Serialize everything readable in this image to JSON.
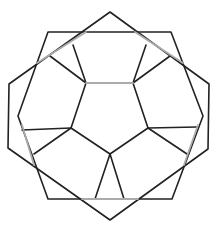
{
  "figure": {
    "colors": {
      "background": "#ffffff",
      "line_dark": "#222222",
      "line_gray": "#ababab"
    },
    "tilted_hexagon": [
      [
        110,
        12
      ],
      [
        209,
        84
      ],
      [
        208,
        149
      ],
      [
        110,
        220
      ],
      [
        8,
        148
      ],
      [
        9,
        84
      ]
    ],
    "upright_hexagon": [
      [
        48,
        32
      ],
      [
        171,
        32
      ],
      [
        203,
        116
      ],
      [
        172,
        199
      ],
      [
        48,
        199
      ],
      [
        18,
        116
      ]
    ],
    "center_pentagon": [
      [
        86,
        83
      ],
      [
        133,
        83
      ],
      [
        148,
        128
      ],
      [
        110,
        154
      ],
      [
        71,
        128
      ]
    ],
    "spokes": [
      [
        [
          86,
          83
        ],
        [
          73,
          45
        ]
      ],
      [
        [
          86,
          83
        ],
        [
          50,
          56
        ]
      ],
      [
        [
          133,
          83
        ],
        [
          146,
          45
        ]
      ],
      [
        [
          133,
          83
        ],
        [
          170,
          56
        ]
      ],
      [
        [
          71,
          128
        ],
        [
          22,
          130
        ]
      ],
      [
        [
          71,
          128
        ],
        [
          34,
          154
        ]
      ],
      [
        [
          148,
          128
        ],
        [
          197,
          127
        ]
      ],
      [
        [
          148,
          128
        ],
        [
          187,
          154
        ]
      ],
      [
        [
          110,
          154
        ],
        [
          95,
          199
        ]
      ],
      [
        [
          110,
          154
        ],
        [
          124,
          199
        ]
      ]
    ],
    "gray_segments": [
      [
        [
          37,
          63
        ],
        [
          86,
          32
        ]
      ],
      [
        [
          135,
          32
        ],
        [
          183,
          63
        ]
      ],
      [
        [
          22,
          125
        ],
        [
          34,
          165
        ]
      ],
      [
        [
          198,
          125
        ],
        [
          184,
          165
        ]
      ],
      [
        [
          82,
          199
        ],
        [
          138,
          199
        ]
      ],
      [
        [
          86,
          83
        ],
        [
          133,
          83
        ]
      ]
    ]
  }
}
